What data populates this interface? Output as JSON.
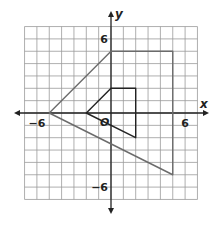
{
  "chart_data": {
    "type": "coordinate-grid",
    "title": "",
    "xlabel": "x",
    "ylabel": "y",
    "origin_label": "O",
    "xlim": [
      -7,
      7
    ],
    "ylim": [
      -7,
      7
    ],
    "grid": true,
    "tick_labels": {
      "x": [
        {
          "value": -6,
          "label": "−6"
        },
        {
          "value": 6,
          "label": "6"
        }
      ],
      "y": [
        {
          "value": 6,
          "label": "6"
        },
        {
          "value": -6,
          "label": "−6"
        }
      ]
    },
    "polygons": [
      {
        "name": "large-quadrilateral",
        "vertices": [
          [
            0,
            5
          ],
          [
            5,
            5
          ],
          [
            5,
            -5
          ],
          [
            -5,
            0
          ]
        ],
        "color": "#6b6b6b"
      },
      {
        "name": "small-quadrilateral",
        "vertices": [
          [
            -2,
            0
          ],
          [
            0,
            2
          ],
          [
            2,
            2
          ],
          [
            2,
            -2
          ]
        ],
        "color": "#222222"
      }
    ]
  }
}
